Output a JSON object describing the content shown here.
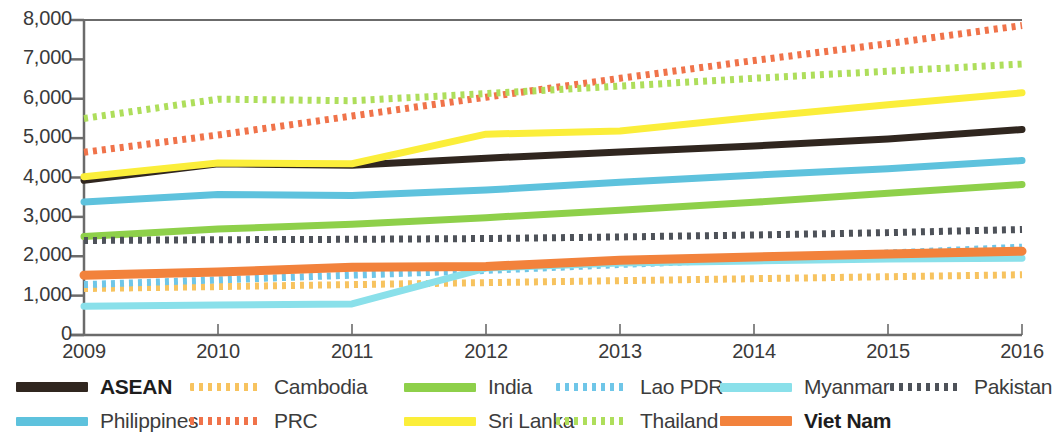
{
  "chart_data": {
    "type": "line",
    "title": "",
    "subtitle": "",
    "xlabel": "",
    "ylabel": "",
    "x": [
      2009,
      2010,
      2011,
      2012,
      2013,
      2014,
      2015,
      2016
    ],
    "xtick_labels": [
      "2009",
      "2010",
      "2011",
      "2012",
      "2013",
      "2014",
      "2015",
      "2016"
    ],
    "ytick_labels": [
      "0",
      "1,000",
      "2,000",
      "3,000",
      "4,000",
      "5,000",
      "6,000",
      "7,000",
      "8,000"
    ],
    "ytick_values": [
      0,
      1000,
      2000,
      3000,
      4000,
      5000,
      6000,
      7000,
      8000
    ],
    "ylim": [
      0,
      8000
    ],
    "xlim": [
      2009,
      2016
    ],
    "grid": false,
    "legend_position": "bottom",
    "series": [
      {
        "name": "ASEAN",
        "color": "#30261f",
        "style": "solid",
        "width": 7,
        "values": [
          3930,
          4350,
          4310,
          4490,
          4650,
          4800,
          4980,
          5220
        ]
      },
      {
        "name": "Cambodia",
        "color": "#f7c35f",
        "style": "dotted",
        "width": 7,
        "values": [
          1180,
          1230,
          1280,
          1330,
          1380,
          1430,
          1480,
          1530
        ]
      },
      {
        "name": "India",
        "color": "#8ed04a",
        "style": "solid",
        "width": 7,
        "values": [
          2500,
          2690,
          2810,
          2980,
          3170,
          3370,
          3600,
          3820
        ]
      },
      {
        "name": "Lao PDR",
        "color": "#6fc6e8",
        "style": "dotted",
        "width": 7,
        "values": [
          1280,
          1400,
          1520,
          1640,
          1790,
          1930,
          2080,
          2230
        ]
      },
      {
        "name": "Myanmar",
        "color": "#8ae0ea",
        "style": "solid",
        "width": 7,
        "values": [
          730,
          760,
          790,
          1700,
          1830,
          1880,
          1930,
          1950
        ]
      },
      {
        "name": "Pakistan",
        "color": "#4e5259",
        "style": "dotted",
        "width": 7,
        "values": [
          2400,
          2420,
          2430,
          2450,
          2490,
          2540,
          2600,
          2680
        ]
      },
      {
        "name": "Philippines",
        "color": "#5ec2dd",
        "style": "solid",
        "width": 7,
        "values": [
          3380,
          3570,
          3540,
          3680,
          3880,
          4060,
          4220,
          4430
        ]
      },
      {
        "name": "PRC",
        "color": "#f0734a",
        "style": "dotted",
        "width": 7,
        "values": [
          4640,
          5080,
          5560,
          6040,
          6520,
          6970,
          7400,
          7860
        ]
      },
      {
        "name": "Sri Lanka",
        "color": "#fbee3a",
        "style": "solid",
        "width": 7,
        "values": [
          4020,
          4370,
          4350,
          5100,
          5180,
          5530,
          5850,
          6150
        ]
      },
      {
        "name": "Thailand",
        "color": "#aede5b",
        "style": "dotted",
        "width": 7,
        "values": [
          5500,
          5990,
          5950,
          6130,
          6320,
          6520,
          6700,
          6880
        ]
      },
      {
        "name": "Viet Nam",
        "color": "#f2823c",
        "style": "solid",
        "width": 9,
        "values": [
          1520,
          1600,
          1720,
          1740,
          1900,
          1980,
          2060,
          2130
        ]
      }
    ]
  },
  "legend": {
    "items": [
      {
        "label": "ASEAN",
        "series": "ASEAN",
        "bold": true
      },
      {
        "label": "Cambodia",
        "series": "Cambodia",
        "bold": false
      },
      {
        "label": "India",
        "series": "India",
        "bold": false
      },
      {
        "label": "Lao PDR",
        "series": "Lao PDR",
        "bold": false
      },
      {
        "label": "Myanmar",
        "series": "Myanmar",
        "bold": false
      },
      {
        "label": "Pakistan",
        "series": "Pakistan",
        "bold": false
      },
      {
        "label": "Philippines",
        "series": "Philippines",
        "bold": false
      },
      {
        "label": "PRC",
        "series": "PRC",
        "bold": false
      },
      {
        "label": "Sri Lanka",
        "series": "Sri Lanka",
        "bold": false
      },
      {
        "label": "Thailand",
        "series": "Thailand",
        "bold": false
      },
      {
        "label": "Viet Nam",
        "series": "Viet Nam",
        "bold": true
      }
    ]
  },
  "axis": {
    "axis_color": "#6b6b6b",
    "text_color": "#3a3a3a"
  }
}
